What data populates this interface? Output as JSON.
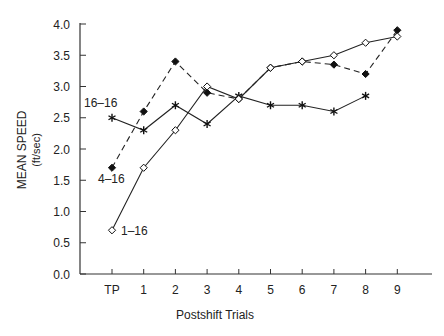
{
  "chart_data": {
    "type": "line",
    "title": "",
    "xlabel": "Postshift Trials",
    "ylabel": "MEAN SPEED",
    "ylabel_units": "(ft/sec)",
    "categories": [
      "TP",
      "1",
      "2",
      "3",
      "4",
      "5",
      "6",
      "7",
      "8",
      "9"
    ],
    "ylim": [
      0.0,
      4.0
    ],
    "yticks": [
      "0.0",
      "0.5",
      "1.0",
      "1.5",
      "2.0",
      "2.5",
      "3.0",
      "3.5",
      "4.0"
    ],
    "grid": false,
    "legend": "inline labels near TP",
    "series": [
      {
        "name": "16–16",
        "line": "solid",
        "marker": "asterisk",
        "values": [
          2.5,
          2.3,
          2.7,
          2.4,
          2.85,
          2.7,
          2.7,
          2.6,
          2.85,
          null
        ]
      },
      {
        "name": "4–16",
        "line": "dashed",
        "marker": "filled-diamond",
        "values": [
          1.7,
          2.6,
          3.4,
          2.9,
          2.8,
          3.3,
          3.4,
          3.35,
          3.2,
          3.9
        ]
      },
      {
        "name": "1–16",
        "line": "solid",
        "marker": "open-diamond",
        "values": [
          0.7,
          1.7,
          2.3,
          3.0,
          2.8,
          3.3,
          3.4,
          3.5,
          3.7,
          3.8
        ]
      }
    ]
  },
  "labels": {
    "series_16_16": "16–16",
    "series_4_16": "4–16",
    "series_1_16": "1–16"
  }
}
